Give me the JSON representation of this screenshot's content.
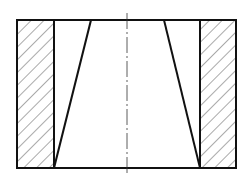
{
  "diagram": {
    "type": "sectional-view",
    "colors": {
      "line": "#111111",
      "hatch": "#555555",
      "background": "#ffffff"
    },
    "outline": {
      "x1": 17,
      "y1": 20,
      "x2": 236,
      "y2": 168
    },
    "left_section": {
      "x1": 17,
      "x2": 54
    },
    "right_section": {
      "x1": 200,
      "x2": 236
    },
    "taper": {
      "top_left_x": 91,
      "top_right_x": 164,
      "bottom_left_x": 54,
      "bottom_right_x": 200
    },
    "centerline": {
      "x": 127,
      "y1": 13,
      "y2": 175
    }
  }
}
